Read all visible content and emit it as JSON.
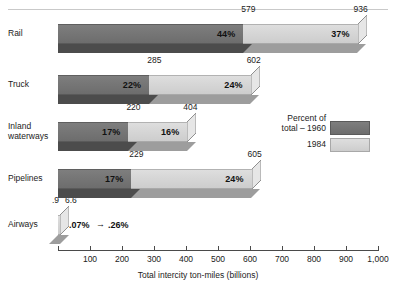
{
  "figure": {
    "axis_title": "Total intercity ton-miles (billions)",
    "x_ticks": [
      "100",
      "200",
      "300",
      "400",
      "500",
      "600",
      "700",
      "800",
      "900",
      "1,000"
    ],
    "x_tick_values": [
      100,
      200,
      300,
      400,
      500,
      600,
      700,
      800,
      900,
      1000
    ]
  },
  "legend": {
    "title_line1": "Percent of",
    "title_line2": "total – 1960",
    "second_label": "1984",
    "color_1960": "#737373",
    "color_1984": "#d6d6d6"
  },
  "chart_data": {
    "type": "bar",
    "orientation": "horizontal",
    "stacked": true,
    "title": "",
    "xlabel": "Total intercity ton-miles (billions)",
    "ylabel": "",
    "xlim": [
      0,
      1000
    ],
    "grid": false,
    "legend_position": "right",
    "categories": [
      "Rail",
      "Truck",
      "Inland waterways",
      "Pipelines",
      "Airways"
    ],
    "series": [
      {
        "name": "Percent of total – 1960",
        "color": "#737373",
        "values": [
          579,
          285,
          220,
          229,
          0.9
        ],
        "value_labels": [
          "579",
          "285",
          "220",
          "229",
          ".9"
        ],
        "percent_labels": [
          "44%",
          "22%",
          "17%",
          "17%",
          ".07%"
        ]
      },
      {
        "name": "1984",
        "color": "#d6d6d6",
        "values": [
          936,
          602,
          404,
          605,
          6.6
        ],
        "value_labels": [
          "936",
          "602",
          "404",
          "605",
          "6.6"
        ],
        "percent_labels": [
          "37%",
          "24%",
          "16%",
          "24%",
          ".26%"
        ]
      }
    ],
    "airways_annotation": {
      "left_percent": ".07%",
      "arrow": "→",
      "right_percent": ".26%"
    }
  },
  "rows": [
    {
      "label_line1": "Rail",
      "label_line2": "",
      "v1960": 579,
      "v1984": 936,
      "lbl1960": "579",
      "lbl1984": "936",
      "pct1960": "44%",
      "pct1984": "37%"
    },
    {
      "label_line1": "Truck",
      "label_line2": "",
      "v1960": 285,
      "v1984": 602,
      "lbl1960": "285",
      "lbl1984": "602",
      "pct1960": "22%",
      "pct1984": "24%"
    },
    {
      "label_line1": "Inland",
      "label_line2": "waterways",
      "v1960": 220,
      "v1984": 404,
      "lbl1960": "220",
      "lbl1984": "404",
      "pct1960": "17%",
      "pct1984": "16%"
    },
    {
      "label_line1": "Pipelines",
      "label_line2": "",
      "v1960": 229,
      "v1984": 605,
      "lbl1960": "229",
      "lbl1984": "605",
      "pct1960": "17%",
      "pct1984": "24%"
    },
    {
      "label_line1": "Airways",
      "label_line2": "",
      "v1960": 0.9,
      "v1984": 6.6,
      "lbl1960": ".9",
      "lbl1984": "6.6",
      "pct1960": ".07%",
      "pct1984": ".26%"
    }
  ]
}
